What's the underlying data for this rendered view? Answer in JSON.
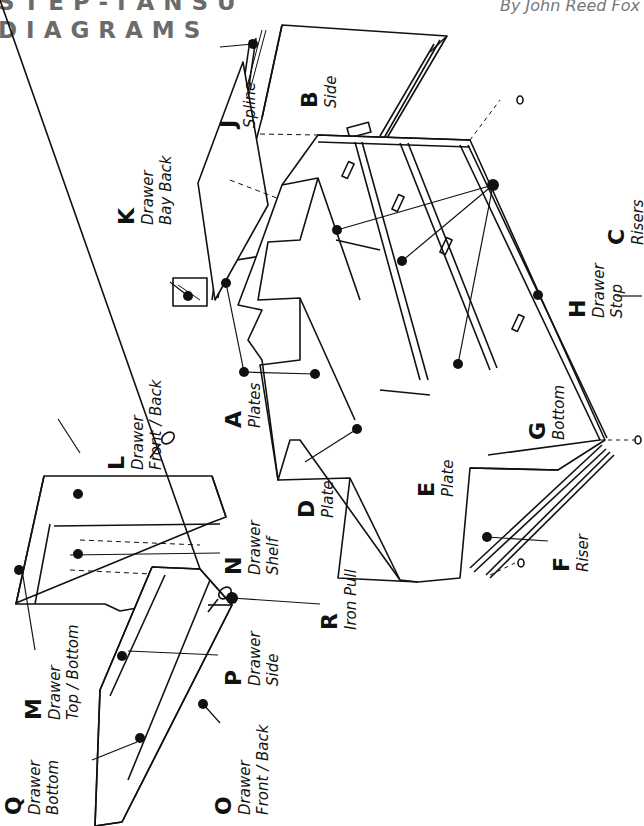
{
  "header": {
    "title_line1": "STEP-TANSU",
    "title_line2": "DIAGRAMS",
    "byline": "By John Reed Fox"
  },
  "labels": {
    "A": {
      "letter": "A",
      "lines": [
        "Plates"
      ]
    },
    "B": {
      "letter": "B",
      "lines": [
        "Side"
      ]
    },
    "C": {
      "letter": "C",
      "lines": [
        "Risers"
      ]
    },
    "D": {
      "letter": "D",
      "lines": [
        "Plate"
      ]
    },
    "E": {
      "letter": "E",
      "lines": [
        "Plate"
      ]
    },
    "F": {
      "letter": "F",
      "lines": [
        "Riser"
      ]
    },
    "G": {
      "letter": "G",
      "lines": [
        "Bottom"
      ]
    },
    "H": {
      "letter": "H",
      "lines": [
        "Drawer",
        "Stop"
      ]
    },
    "J": {
      "letter": "J",
      "lines": [
        "Spline"
      ]
    },
    "K": {
      "letter": "K",
      "lines": [
        "Drawer",
        "Bay Back"
      ]
    },
    "L": {
      "letter": "L",
      "lines": [
        "Drawer",
        "Front / Back"
      ]
    },
    "M": {
      "letter": "M",
      "lines": [
        "Drawer",
        "Top / Bottom"
      ]
    },
    "N": {
      "letter": "N",
      "lines": [
        "Drawer",
        "Shelf"
      ]
    },
    "O": {
      "letter": "O",
      "lines": [
        "Drawer",
        "Front / Back"
      ]
    },
    "P": {
      "letter": "P",
      "lines": [
        "Drawer",
        "Side"
      ]
    },
    "Q": {
      "letter": "Q",
      "lines": [
        "Drawer",
        "Bottom"
      ]
    },
    "R": {
      "letter": "R",
      "lines": [
        "Iron Pull"
      ]
    }
  }
}
